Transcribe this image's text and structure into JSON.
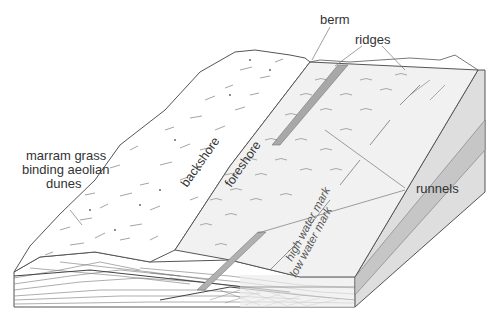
{
  "diagram": {
    "title": "",
    "type": "block diagram of a beach profile",
    "colors": {
      "outline": "#555555",
      "dune_fill": "#ffffff",
      "beach_fill": "#f0f0f0",
      "runnel_fill": "#a8a8a8",
      "side_face": "#d9d9d9",
      "water_face": "#c8c8c8",
      "label_text": "#333333",
      "leader_line": "#777777"
    },
    "labels": {
      "berm": "berm",
      "ridges": "ridges",
      "runnels": "runnels",
      "marram_line1": "marram grass",
      "marram_line2": "binding aeolian",
      "marram_line3": "dunes",
      "backshore": "backshore",
      "foreshore": "foreshore",
      "high_water": "high water mark",
      "low_water": "low water mark"
    }
  }
}
